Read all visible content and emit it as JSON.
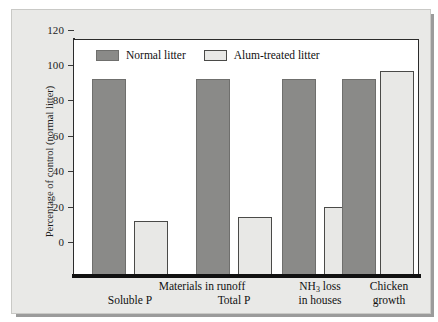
{
  "chart_data": {
    "type": "bar",
    "title": "",
    "subtitle": "",
    "xlabel": "",
    "ylabel": "Percentage of control (normal litter)",
    "ylim": [
      0,
      120
    ],
    "yticks": [
      0,
      20,
      40,
      60,
      80,
      100,
      120
    ],
    "grid": false,
    "legend_position": "top-left-inside",
    "categories": [
      "Soluble P",
      "Total P",
      "NH3 loss in houses",
      "Chicken growth"
    ],
    "category_labels": [
      {
        "line1": "Soluble P",
        "line2": ""
      },
      {
        "line1": "Total P",
        "line2": ""
      },
      {
        "line1": "NH",
        "sub": "3",
        "line1_tail": " loss",
        "line2": "in houses"
      },
      {
        "line1": "Chicken",
        "line2": "growth"
      }
    ],
    "group_span_label": "Materials in runoff",
    "group_span_covers": [
      "Soluble P",
      "Total P"
    ],
    "series": [
      {
        "name": "Normal litter",
        "color": "#8a8a88",
        "values": [
          100,
          100,
          100,
          100
        ]
      },
      {
        "name": "Alum-treated litter",
        "color": "#e8e8e6",
        "values": [
          28,
          30,
          35,
          104
        ]
      }
    ]
  },
  "legend": {
    "entries": [
      {
        "label": "Normal litter",
        "swatch": "normal-litter-swatch"
      },
      {
        "label": "Alum-treated litter",
        "swatch": "alum-treated-litter-swatch"
      }
    ]
  },
  "axis": {
    "y_title": "Percentage of control (normal litter)",
    "y_tick_labels": [
      "120",
      "100",
      "80",
      "60",
      "40",
      "20",
      "0"
    ]
  },
  "x_axis": {
    "span_label": "Materials in runoff",
    "labels": [
      {
        "top": "",
        "bottom": "Soluble P"
      },
      {
        "top": "",
        "bottom": "Total P"
      },
      {
        "top": "NH3 loss",
        "bottom": "in houses"
      },
      {
        "top": "Chicken",
        "bottom": "growth"
      }
    ]
  },
  "colors": {
    "normal_litter": "#8a8a88",
    "alum_treated_litter": "#e8e8e6",
    "panel_background": "#e9e9e7",
    "plot_background": "#ffffff",
    "axis": "#2b2b2b"
  }
}
